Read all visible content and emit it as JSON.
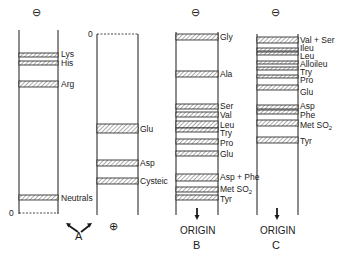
{
  "colors": {
    "line": "#1a1a1a",
    "hatch": "#9a9a9a",
    "background": "#ffffff"
  },
  "panels": [
    {
      "id": "A-left",
      "top_symbol": "⊖",
      "zero_label": "0",
      "bands": [
        {
          "label": "Lys",
          "y1": 53,
          "y2": 57
        },
        {
          "label": "His",
          "y1": 61,
          "y2": 65
        },
        {
          "label": "Arg",
          "y1": 81,
          "y2": 87
        },
        {
          "label": "Neutrals",
          "y1": 195,
          "y2": 200
        }
      ]
    },
    {
      "id": "A-right",
      "bottom_symbol": "⊕",
      "zero_label": "0",
      "bands": [
        {
          "label": "Glu",
          "y1": 124,
          "y2": 133
        },
        {
          "label": "Asp",
          "y1": 160,
          "y2": 166
        },
        {
          "label": "Cysteic",
          "y1": 178,
          "y2": 184
        }
      ]
    },
    {
      "id": "B",
      "top_symbol": "⊖",
      "origin_label": "ORIGIN",
      "panel_letter": "B",
      "bands": [
        {
          "label": "Gly",
          "y1": 34,
          "y2": 40
        },
        {
          "label": "Ala",
          "y1": 71,
          "y2": 77
        },
        {
          "label": "Ser",
          "y1": 104,
          "y2": 109
        },
        {
          "label": "Val",
          "y1": 112,
          "y2": 117
        },
        {
          "label": "Leu",
          "y1": 121,
          "y2": 128
        },
        {
          "label": "Try",
          "y1": 128,
          "y2": 132
        },
        {
          "label": "Pro",
          "y1": 139,
          "y2": 144
        },
        {
          "label": "Glu",
          "y1": 151,
          "y2": 156
        },
        {
          "label": "Asp + Phe",
          "y1": 174,
          "y2": 181
        },
        {
          "label": "MetSO2",
          "y1": 187,
          "y2": 192
        },
        {
          "label": "Tyr",
          "y1": 195,
          "y2": 200
        }
      ]
    },
    {
      "id": "C",
      "top_symbol": "⊖",
      "origin_label": "ORIGIN",
      "panel_letter": "C",
      "bands": [
        {
          "label": "Val + Ser",
          "y1": 37,
          "y2": 43
        },
        {
          "label": "Ileu",
          "y1": 48,
          "y2": 51
        },
        {
          "label": "Leu",
          "y1": 52,
          "y2": 55
        },
        {
          "label": "Alloileu",
          "y1": 61,
          "y2": 64
        },
        {
          "label": "Try",
          "y1": 67,
          "y2": 70
        },
        {
          "label": "Pro",
          "y1": 75,
          "y2": 78
        },
        {
          "label": "Glu",
          "y1": 85,
          "y2": 90
        },
        {
          "label": "Asp",
          "y1": 105,
          "y2": 109
        },
        {
          "label": "Phe",
          "y1": 110,
          "y2": 114
        },
        {
          "label": "MetSO2",
          "y1": 120,
          "y2": 126
        },
        {
          "label": "Tyr",
          "y1": 137,
          "y2": 143
        }
      ]
    }
  ],
  "labels": {
    "panelA": "A",
    "minus": "⊖",
    "plus": "⊕",
    "zero": "0",
    "origin": "ORIGIN",
    "panelB": "B",
    "panelC": "C",
    "A_left": {
      "lys": "Lys",
      "his": "His",
      "arg": "Arg",
      "neutrals": "Neutrals"
    },
    "A_right": {
      "glu": "Glu",
      "asp": "Asp",
      "cysteic": "Cysteic"
    },
    "B": {
      "gly": "Gly",
      "ala": "Ala",
      "ser": "Ser",
      "val": "Val",
      "leu": "Leu",
      "try": "Try",
      "pro": "Pro",
      "glu": "Glu",
      "asp_phe": "Asp + Phe",
      "met": "Met SO",
      "met_sub": "2",
      "tyr": "Tyr"
    },
    "C": {
      "val_ser": "Val + Ser",
      "ileu": "Ileu",
      "leu": "Leu",
      "alloileu": "Alloileu",
      "try": "Try",
      "pro": "Pro",
      "glu": "Glu",
      "asp": "Asp",
      "phe": "Phe",
      "met": "Met SO",
      "met_sub": "2",
      "tyr": "Tyr"
    }
  }
}
